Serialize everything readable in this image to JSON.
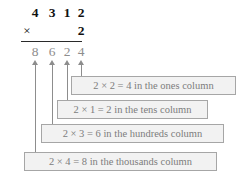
{
  "problem": {
    "multiplicand_digits": [
      "4",
      "3",
      "1",
      "2"
    ],
    "operator": "×",
    "multiplier": "2",
    "product_digits": [
      "8",
      "6",
      "2",
      "4"
    ]
  },
  "callouts": [
    {
      "id": "ones",
      "text": "2 × 2 = 4 in the ones column"
    },
    {
      "id": "tens",
      "text": "2 × 1 = 2 in the tens column"
    },
    {
      "id": "hundreds",
      "text": "2 × 3 = 6 in the hundreds column"
    },
    {
      "id": "thousands",
      "text": "2 × 4 = 8 in the thousands column"
    }
  ],
  "colors": {
    "ink": "#111111",
    "gray_text": "#8d8d8d",
    "box_fill": "#f2f2f2",
    "box_border": "#a6a6a6"
  }
}
